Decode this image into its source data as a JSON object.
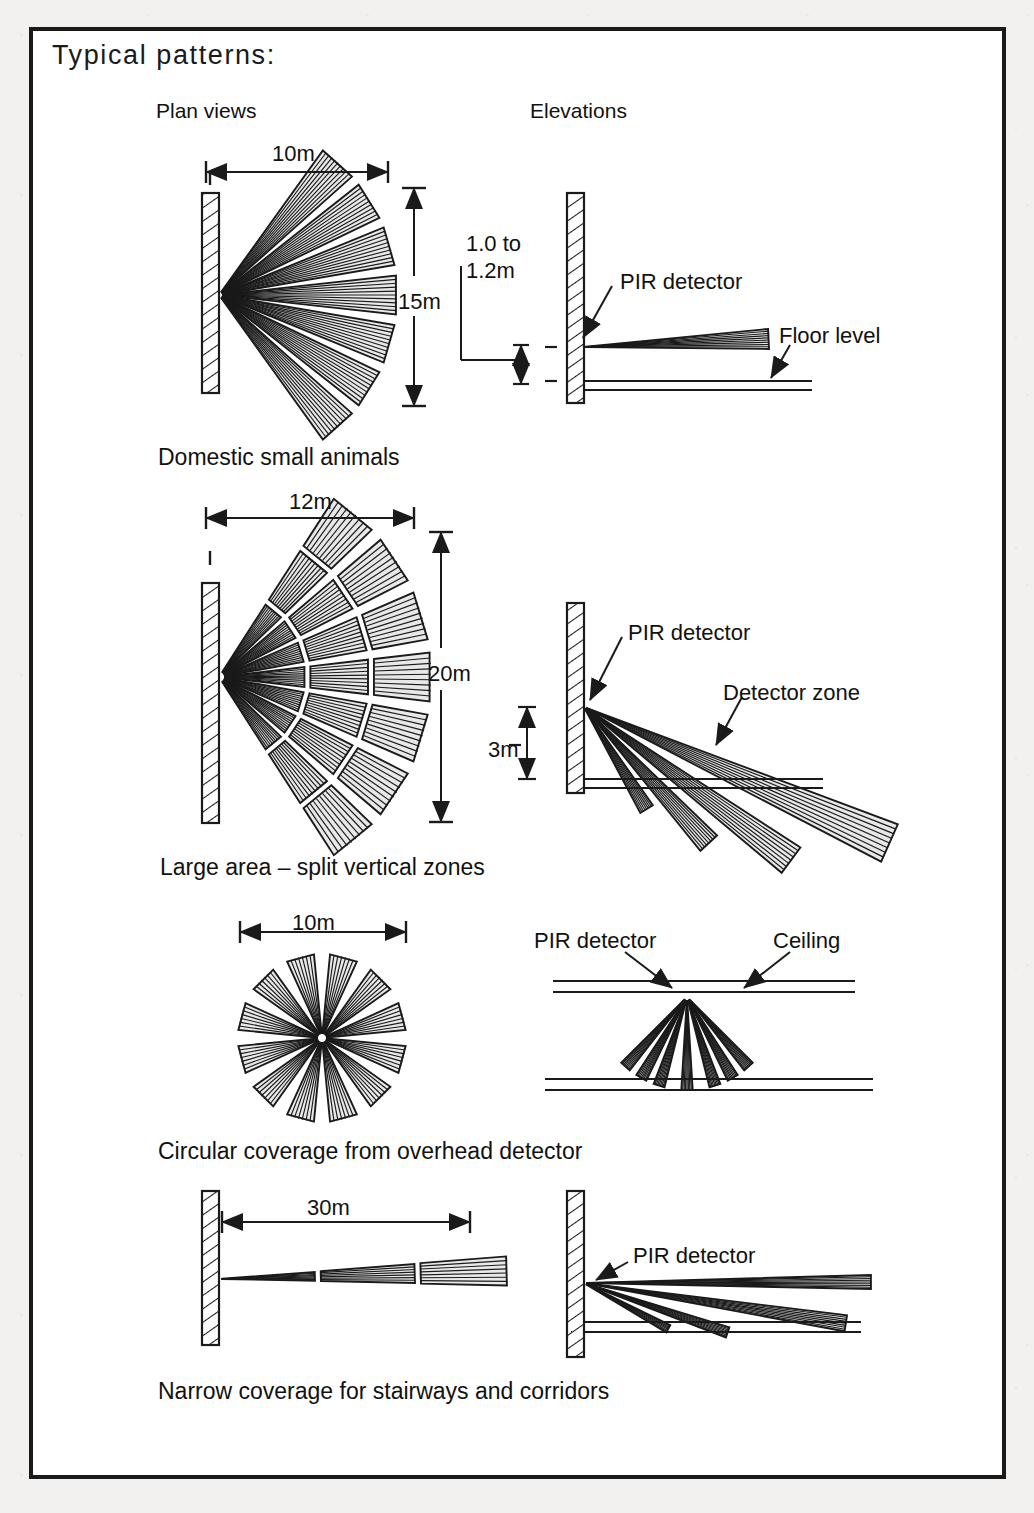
{
  "page": {
    "heading": "Typical patterns:",
    "column_headers": {
      "plan": "Plan views",
      "elevation": "Elevations"
    }
  },
  "colors": {
    "ink": "#1a1a1a",
    "page": "#f2f1ef",
    "sheet": "#ffffff",
    "beam_fill": "#e8e8e8"
  },
  "sections": [
    {
      "id": "domestic",
      "caption": "Domestic small animals",
      "plan": {
        "type": "fan",
        "width_dim": "10m",
        "depth_dim": "15m",
        "beams": 7,
        "rings": 1,
        "spread_deg": 112,
        "mount": "wall"
      },
      "elevation": {
        "height_dim": "1.0 to\n1.2m",
        "height_dim_line1": "1.0 to",
        "height_dim_line2": "1.2m",
        "labels": [
          "PIR detector",
          "Floor level"
        ],
        "beams": 1,
        "mount": "wall"
      }
    },
    {
      "id": "large-area",
      "caption": "Large area – split vertical zones",
      "plan": {
        "type": "fan-split",
        "width_dim": "12m",
        "depth_dim": "20m",
        "beams": 7,
        "rings": 3,
        "spread_deg": 118,
        "mount": "wall"
      },
      "elevation": {
        "height_dim": "3m",
        "labels": [
          "PIR detector",
          "Detector zone"
        ],
        "beams": 4,
        "mount": "wall"
      }
    },
    {
      "id": "circular",
      "caption": "Circular coverage from overhead detector",
      "plan": {
        "type": "radial",
        "width_dim": "10m",
        "beams": 12,
        "rings": 1,
        "spread_deg": 360,
        "mount": "ceiling"
      },
      "elevation": {
        "labels": [
          "PIR detector",
          "Ceiling"
        ],
        "beams": 7,
        "mount": "ceiling"
      }
    },
    {
      "id": "narrow",
      "caption": "Narrow coverage for stairways and corridors",
      "plan": {
        "type": "corridor",
        "width_dim": "30m",
        "beams": 1,
        "rings": 3,
        "spread_deg": 9,
        "mount": "wall"
      },
      "elevation": {
        "labels": [
          "PIR detector"
        ],
        "beams": 4,
        "mount": "wall"
      }
    }
  ],
  "labels": {
    "pir_detector": "PIR detector",
    "floor_level": "Floor level",
    "detector_zone": "Detector zone",
    "ceiling": "Ceiling"
  }
}
